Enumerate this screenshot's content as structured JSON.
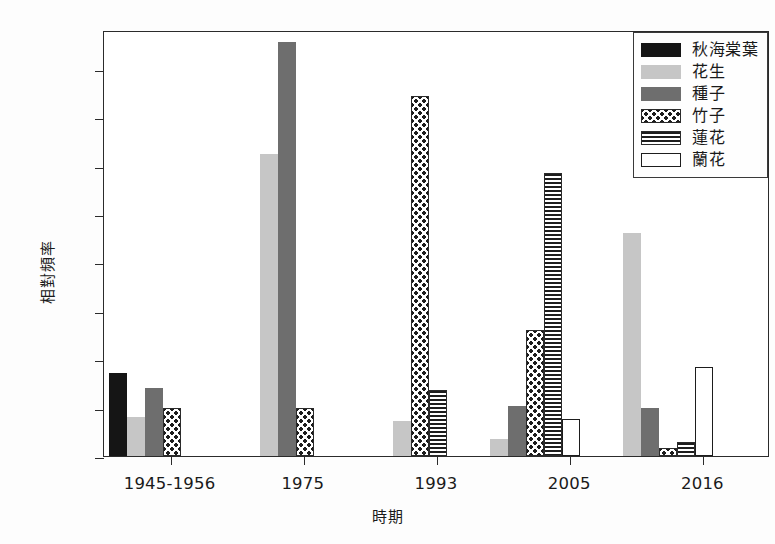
{
  "chart_data": {
    "type": "bar",
    "title": "",
    "xlabel": "時期",
    "ylabel": "相對頻率",
    "categories": [
      "1945-1956",
      "1975",
      "1993",
      "2005",
      "2016"
    ],
    "ylim": [
      0,
      22.0
    ],
    "yticks": [
      "0.0",
      "2.5",
      "5.0",
      "7.5",
      "10.0",
      "12.5",
      "15.0",
      "17.5",
      "20.0"
    ],
    "ytick_values": [
      0.0,
      2.5,
      5.0,
      7.5,
      10.0,
      12.5,
      15.0,
      17.5,
      20.0
    ],
    "grid": false,
    "legend_position": "upper right",
    "series": [
      {
        "name": "秋海棠葉",
        "pattern": "solid-black",
        "color": "#151515",
        "values": [
          4.3,
          0,
          0,
          0,
          0
        ]
      },
      {
        "name": "花生",
        "pattern": "light-gray",
        "color": "#c6c6c6",
        "values": [
          2.0,
          15.6,
          1.8,
          0.9,
          11.5
        ]
      },
      {
        "name": "種子",
        "pattern": "dark-gray",
        "color": "#6e6e6e",
        "values": [
          3.5,
          21.4,
          0,
          2.6,
          2.5
        ]
      },
      {
        "name": "竹子",
        "pattern": "dotted",
        "color": "#ffffff",
        "values": [
          2.5,
          2.5,
          18.6,
          6.5,
          0.4
        ]
      },
      {
        "name": "蓮花",
        "pattern": "hlines",
        "color": "#ffffff",
        "values": [
          0,
          0,
          3.4,
          14.6,
          0.7
        ]
      },
      {
        "name": "蘭花",
        "pattern": "open",
        "color": "#ffffff",
        "values": [
          0,
          0,
          0,
          1.9,
          4.6
        ]
      }
    ]
  }
}
